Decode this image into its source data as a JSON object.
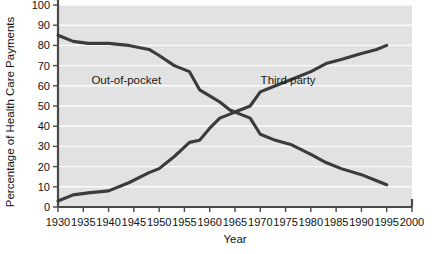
{
  "chart_data": {
    "type": "line",
    "title": "",
    "xlabel": "Year",
    "ylabel": "Percentage of Health Care Payments",
    "xlim": [
      1930,
      2000
    ],
    "ylim": [
      0,
      100
    ],
    "grid": true,
    "legend_position": "inline-annotations",
    "xticks": [
      1930,
      1935,
      1940,
      1945,
      1950,
      1955,
      1960,
      1965,
      1970,
      1975,
      1980,
      1985,
      1990,
      1995,
      2000
    ],
    "xtick_labels": [
      "1930",
      "1935",
      "1940",
      "1945",
      "1950",
      "1955",
      "1960",
      "1965",
      "1970",
      "1975",
      "1980",
      "1985",
      "1990",
      "1995",
      "2000"
    ],
    "yticks": [
      0,
      10,
      20,
      30,
      40,
      50,
      60,
      70,
      80,
      90,
      100
    ],
    "ytick_labels": [
      "0",
      "10",
      "20",
      "30",
      "40",
      "50",
      "60",
      "70",
      "80",
      "90",
      "100"
    ],
    "series": [
      {
        "name": "Out-of-pocket",
        "x": [
          1930,
          1933,
          1936,
          1940,
          1944,
          1948,
          1950,
          1953,
          1956,
          1958,
          1960,
          1962,
          1964,
          1965,
          1966,
          1968,
          1970,
          1973,
          1976,
          1980,
          1983,
          1986,
          1990,
          1993,
          1995
        ],
        "values": [
          85,
          82,
          81,
          81,
          80,
          78,
          75,
          70,
          67,
          58,
          55,
          52,
          48,
          47,
          46,
          44,
          36,
          33,
          31,
          26,
          22,
          19,
          16,
          13,
          11
        ]
      },
      {
        "name": "Third party",
        "x": [
          1930,
          1933,
          1936,
          1940,
          1944,
          1948,
          1950,
          1953,
          1956,
          1958,
          1960,
          1962,
          1964,
          1965,
          1966,
          1968,
          1970,
          1973,
          1976,
          1980,
          1983,
          1986,
          1990,
          1993,
          1995
        ],
        "values": [
          3,
          6,
          7,
          8,
          12,
          17,
          19,
          25,
          32,
          33,
          39,
          44,
          46,
          47,
          48,
          50,
          57,
          60,
          63,
          67,
          71,
          73,
          76,
          78,
          80
        ]
      }
    ],
    "annotations": [
      {
        "text": "Out-of-pocket",
        "x": 1943.5,
        "y": 63
      },
      {
        "text": "Third party",
        "x": 1975.5,
        "y": 63
      }
    ]
  }
}
